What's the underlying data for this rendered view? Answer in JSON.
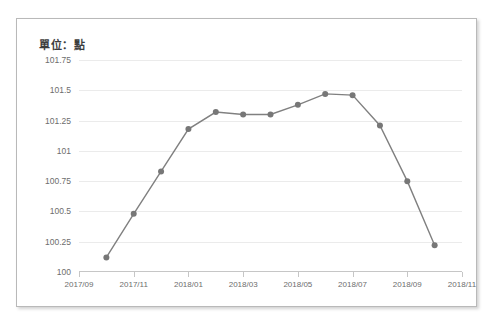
{
  "card": {
    "unit_title": "單位：點"
  },
  "chart_data": {
    "type": "line",
    "title": "單位：點",
    "xlabel": "",
    "ylabel": "",
    "ylim": [
      100,
      101.75
    ],
    "yticks": [
      "100",
      "100.25",
      "100.5",
      "100.75",
      "101",
      "101.25",
      "101.5",
      "101.75"
    ],
    "ytick_values": [
      100,
      100.25,
      100.5,
      100.75,
      101,
      101.25,
      101.5,
      101.75
    ],
    "xticks": [
      "2017/09",
      "2017/11",
      "2018/01",
      "2018/03",
      "2018/05",
      "2018/07",
      "2018/09",
      "2018/11"
    ],
    "grid": true,
    "legend": "none",
    "line_color": "#808080",
    "marker_color": "#777777",
    "gridline_color": "#ebebeb",
    "categories": [
      "2017/10",
      "2017/11",
      "2017/12",
      "2018/01",
      "2018/02",
      "2018/03",
      "2018/04",
      "2018/05",
      "2018/06",
      "2018/07",
      "2018/08",
      "2018/09",
      "2018/10"
    ],
    "values": [
      100.12,
      100.48,
      100.83,
      101.18,
      101.32,
      101.3,
      101.3,
      101.38,
      101.47,
      101.46,
      101.21,
      100.75,
      100.22
    ]
  }
}
